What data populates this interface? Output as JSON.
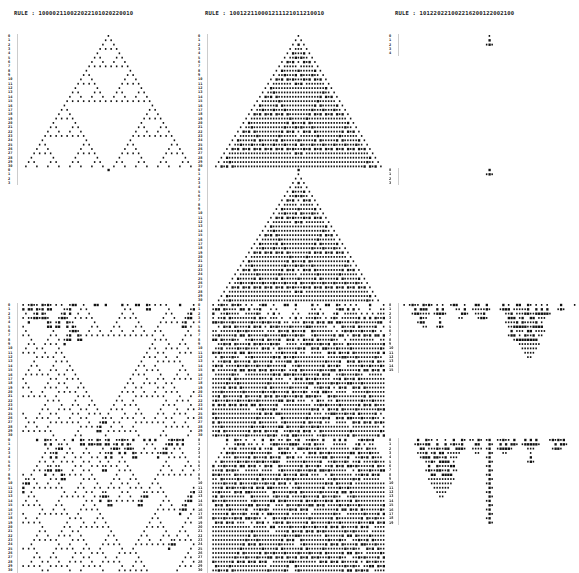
{
  "figure": {
    "type": "cellular automaton evolution printout",
    "columns": [
      {
        "rule_label": "RULE : 100002110022022101020220010",
        "rule": "100002110022022101020220010"
      },
      {
        "rule_label": "RULE : 100122110001211121011210010",
        "rule": "100122110001211121011210010"
      },
      {
        "rule_label": "RULE : 101220221002216200122002100",
        "rule": "101220221002210200122002100"
      }
    ],
    "rows": [
      {
        "init": "seed1",
        "generations": 30
      },
      {
        "init": "seed2",
        "generations": 30
      },
      {
        "init": "random_a",
        "generations": 30
      },
      {
        "init": "random_b",
        "generations": 30
      }
    ],
    "visible_generations": [
      [
        30,
        30,
        4
      ],
      [
        3,
        30,
        3
      ],
      [
        30,
        30,
        15
      ],
      [
        30,
        30,
        19
      ]
    ],
    "width_cells": 63
  }
}
